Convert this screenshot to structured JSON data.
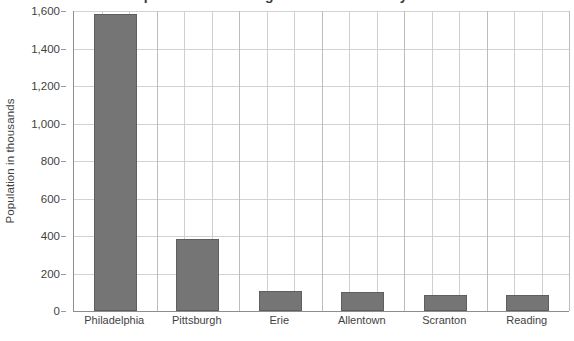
{
  "chart_data": {
    "type": "bar",
    "title": "Population of the largest cities in Pennsylvania",
    "subtitle": "",
    "xlabel": "",
    "ylabel": "Population in thousands",
    "categories": [
      "Philadelphia",
      "Pittsburgh",
      "Erie",
      "Allentown",
      "Scranton",
      "Reading"
    ],
    "values": [
      1585,
      385,
      107,
      101,
      85,
      85
    ],
    "ylim": [
      0,
      1600
    ],
    "yticks": [
      0,
      200,
      400,
      600,
      800,
      1000,
      1200,
      1400,
      1600
    ],
    "ytick_labels": [
      "0",
      "200",
      "400",
      "600",
      "800",
      "1,000",
      "1,200",
      "1,400",
      "1,600"
    ],
    "grid": "both",
    "vertical_gridlines_per_category": 3,
    "legend": null,
    "legend_position": "none",
    "series": [
      {
        "name": "Population in thousands",
        "values": [
          1585,
          385,
          107,
          101,
          85,
          85
        ]
      }
    ],
    "colors": {
      "bar_fill": "#757575",
      "bar_border": "#5f5f5f",
      "grid_horizontal": "#d2d2d2",
      "grid_vertical": "#cfcfcf",
      "axis_line": "#8d8d8d",
      "text": "#3f3f3f",
      "plot_background": "#ffffff"
    }
  }
}
